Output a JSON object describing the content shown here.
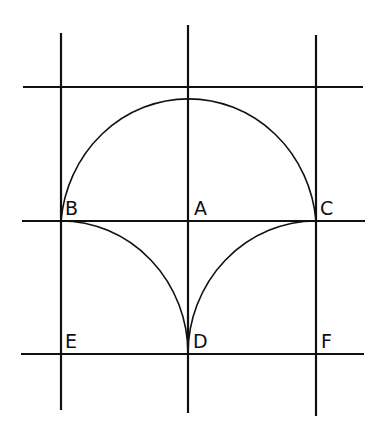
{
  "diagram": {
    "stroke_color": "#111111",
    "background": "#ffffff",
    "lines": {
      "verticals": [
        {
          "id": "left",
          "x": 61,
          "y1": 33,
          "y2": 410
        },
        {
          "id": "middle",
          "x": 188,
          "y1": 25,
          "y2": 413
        },
        {
          "id": "right",
          "x": 316,
          "y1": 35,
          "y2": 416
        }
      ],
      "horizontals": [
        {
          "id": "top",
          "y": 87,
          "x1": 23,
          "x2": 363
        },
        {
          "id": "middle",
          "y": 221,
          "x1": 22,
          "x2": 365
        },
        {
          "id": "bottom",
          "y": 354,
          "x1": 21,
          "x2": 364
        }
      ]
    },
    "points": {
      "A": {
        "label": "A",
        "x": 188,
        "y": 221
      },
      "B": {
        "label": "B",
        "x": 61,
        "y": 221
      },
      "C": {
        "label": "C",
        "x": 316,
        "y": 221
      },
      "D": {
        "label": "D",
        "x": 188,
        "y": 354
      },
      "E": {
        "label": "E",
        "x": 61,
        "y": 354
      },
      "F": {
        "label": "F",
        "x": 316,
        "y": 354
      }
    },
    "arcs": [
      {
        "id": "upper-semicircle",
        "center": "A",
        "from": "B",
        "to": "C",
        "through_top": true
      },
      {
        "id": "lower-left-quarter",
        "center": "E",
        "from": "B",
        "to": "D"
      },
      {
        "id": "lower-right-quarter",
        "center": "F",
        "from": "C",
        "to": "D"
      }
    ]
  }
}
